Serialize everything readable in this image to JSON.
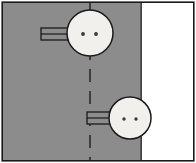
{
  "figure": {
    "type": "line-drawing",
    "canvas": {
      "width": 196,
      "height": 163
    },
    "colors": {
      "frame_stroke": "#1a1a1a",
      "panel_gray": "#8c8c8c",
      "panel_white": "#ffffff",
      "circle_fill": "#f2f0ec",
      "circle_stroke": "#1a1a1a",
      "hole_fill": "#3a3a3a",
      "tab_fill": "#8c8c8c",
      "tab_stroke": "#1a1a1a",
      "centerline_stroke": "#2b2b2b",
      "page_background": "#ffffff"
    },
    "frame": {
      "label": "drawing-border",
      "x": 2,
      "y": 2,
      "width": 192,
      "height": 159,
      "stroke_width": 1.6
    },
    "panels": [
      {
        "name": "gray-panel",
        "fill_key": "panel_gray",
        "x": 3,
        "y": 3,
        "width": 138,
        "height": 157
      },
      {
        "name": "white-panel",
        "fill_key": "panel_white",
        "x": 141,
        "y": 3,
        "width": 52,
        "height": 157
      }
    ],
    "divider": {
      "name": "panel-divider",
      "x": 141,
      "y1": 3,
      "y2": 160,
      "stroke_width": 1.4
    },
    "centerline": {
      "name": "vertical-centerline",
      "x": 90,
      "y1": 3,
      "y2": 160,
      "stroke_width": 1.6,
      "dash": "13 9"
    },
    "circles": [
      {
        "name": "upper-fastener",
        "cx": 90,
        "cy": 33,
        "r": 23,
        "stroke_width": 1.5,
        "holes": [
          {
            "name": "upper-hole-left",
            "cx": 83,
            "cy": 34,
            "r": 1.9
          },
          {
            "name": "upper-hole-right",
            "cx": 96,
            "cy": 34,
            "r": 1.9
          }
        ]
      },
      {
        "name": "lower-fastener",
        "cx": 130,
        "cy": 118,
        "r": 21,
        "stroke_width": 1.5,
        "holes": [
          {
            "name": "lower-hole-left",
            "cx": 124,
            "cy": 119,
            "r": 1.7
          },
          {
            "name": "lower-hole-right",
            "cx": 136,
            "cy": 119,
            "r": 1.7
          }
        ]
      }
    ],
    "tabs": [
      {
        "name": "upper-tab",
        "x": 41,
        "y": 28,
        "width": 30,
        "height": 12,
        "stroke_width": 1.3,
        "mid_divider_y": 34
      },
      {
        "name": "lower-tab",
        "x": 87,
        "y": 112,
        "width": 25,
        "height": 12,
        "stroke_width": 1.3,
        "mid_divider_y": 118
      }
    ]
  }
}
